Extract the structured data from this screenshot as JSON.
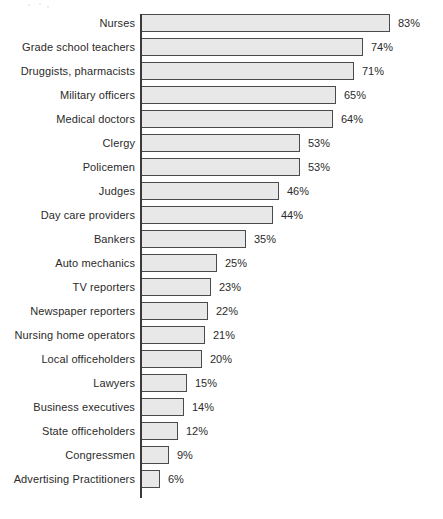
{
  "chart_data": {
    "type": "bar",
    "orientation": "horizontal",
    "title": "",
    "subtitle": "",
    "xlabel": "",
    "ylabel": "",
    "xlim": [
      0,
      100
    ],
    "grid": false,
    "legend": null,
    "value_suffix": "%",
    "categories": [
      "Nurses",
      "Grade school teachers",
      "Druggists, pharmacists",
      "Military officers",
      "Medical doctors",
      "Clergy",
      "Policemen",
      "Judges",
      "Day care providers",
      "Bankers",
      "Auto mechanics",
      "TV reporters",
      "Newspaper reporters",
      "Nursing home operators",
      "Local officeholders",
      "Lawyers",
      "Business executives",
      "State officeholders",
      "Congressmen",
      "Advertising Practitioners"
    ],
    "values": [
      83,
      74,
      71,
      65,
      64,
      53,
      53,
      46,
      44,
      35,
      25,
      23,
      22,
      21,
      20,
      15,
      14,
      12,
      9,
      6
    ],
    "value_labels": [
      "83%",
      "74%",
      "71%",
      "65%",
      "64%",
      "53%",
      "53%",
      "46%",
      "44%",
      "35%",
      "25%",
      "23%",
      "22%",
      "21%",
      "20%",
      "15%",
      "14%",
      "12%",
      "9%",
      "6%"
    ],
    "bar_fill_color": "#e8e8e8",
    "bar_border_color": "#4a4a4a",
    "axis_color": "#3a3a3a",
    "text_color": "#2b2b2b",
    "background_color": "#ffffff"
  }
}
